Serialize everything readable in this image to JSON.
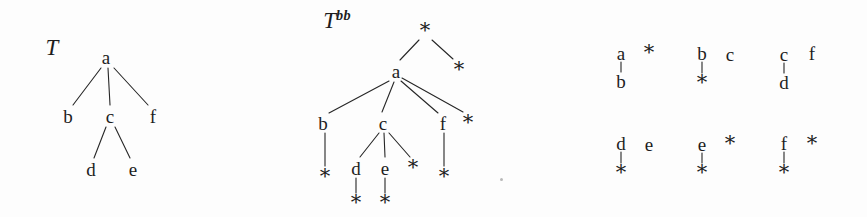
{
  "figure": {
    "domain": "diagram",
    "type": "tree-diagram",
    "background_color": "#fdfdfd",
    "ink_color": "#1d1d1d",
    "width": 867,
    "height": 217
  },
  "panels": [
    {
      "id": "original-tree",
      "label": {
        "base": "T",
        "sup": ""
      },
      "label_pos": {
        "x": 52,
        "y": 47
      },
      "description": "Original rooted ordered tree T with root a",
      "nodes": [
        {
          "id": "t-a",
          "text": "a",
          "kind": "letter",
          "x": 106,
          "y": 57
        },
        {
          "id": "t-b",
          "text": "b",
          "kind": "letter",
          "x": 68,
          "y": 116
        },
        {
          "id": "t-c",
          "text": "c",
          "kind": "letter",
          "x": 110,
          "y": 116
        },
        {
          "id": "t-f",
          "text": "f",
          "kind": "letter",
          "x": 153,
          "y": 116
        },
        {
          "id": "t-d",
          "text": "d",
          "kind": "letter",
          "x": 91,
          "y": 169
        },
        {
          "id": "t-e",
          "text": "e",
          "kind": "letter",
          "x": 133,
          "y": 169
        }
      ],
      "edges": [
        {
          "from": "t-a",
          "to": "t-b",
          "x1": 101,
          "y1": 68,
          "x2": 73,
          "y2": 105
        },
        {
          "from": "t-a",
          "to": "t-c",
          "x1": 108,
          "y1": 68,
          "x2": 110,
          "y2": 105
        },
        {
          "from": "t-a",
          "to": "t-f",
          "x1": 114,
          "y1": 68,
          "x2": 148,
          "y2": 105
        },
        {
          "from": "t-c",
          "to": "t-d",
          "x1": 106,
          "y1": 127,
          "x2": 94,
          "y2": 158
        },
        {
          "from": "t-c",
          "to": "t-e",
          "x1": 115,
          "y1": 127,
          "x2": 130,
          "y2": 158
        }
      ]
    },
    {
      "id": "binary-brother-tree",
      "label": {
        "base": "T",
        "sup": "bb"
      },
      "label_pos": {
        "x": 337,
        "y": 20
      },
      "description": "Binary-brother representation T^bb of the tree T",
      "nodes": [
        {
          "id": "bb-root",
          "text": "*",
          "kind": "star",
          "x": 425,
          "y": 30
        },
        {
          "id": "bb-a",
          "text": "a",
          "kind": "letter",
          "x": 396,
          "y": 71
        },
        {
          "id": "bb-rstar",
          "text": "*",
          "kind": "star",
          "x": 459,
          "y": 69
        },
        {
          "id": "bb-b",
          "text": "b",
          "kind": "letter",
          "x": 323,
          "y": 123
        },
        {
          "id": "bb-c",
          "text": "c",
          "kind": "letter",
          "x": 383,
          "y": 123
        },
        {
          "id": "bb-f",
          "text": "f",
          "kind": "letter",
          "x": 443,
          "y": 123
        },
        {
          "id": "bb-fstar",
          "text": "*",
          "kind": "star",
          "x": 468,
          "y": 122
        },
        {
          "id": "bb-bstar",
          "text": "*",
          "kind": "star",
          "x": 325,
          "y": 176
        },
        {
          "id": "bb-d",
          "text": "d",
          "kind": "letter",
          "x": 356,
          "y": 168
        },
        {
          "id": "bb-e",
          "text": "e",
          "kind": "letter",
          "x": 385,
          "y": 168
        },
        {
          "id": "bb-cstar",
          "text": "*",
          "kind": "star",
          "x": 413,
          "y": 167
        },
        {
          "id": "bb-fchildstar",
          "text": "*",
          "kind": "star",
          "x": 444,
          "y": 176
        },
        {
          "id": "bb-dstar",
          "text": "*",
          "kind": "star",
          "x": 356,
          "y": 202
        },
        {
          "id": "bb-estar",
          "text": "*",
          "kind": "star",
          "x": 385,
          "y": 202
        }
      ],
      "edges": [
        {
          "from": "bb-root",
          "to": "bb-a",
          "x1": 419,
          "y1": 40,
          "x2": 400,
          "y2": 60
        },
        {
          "from": "bb-root",
          "to": "bb-rstar",
          "x1": 432,
          "y1": 40,
          "x2": 453,
          "y2": 59
        },
        {
          "from": "bb-a",
          "to": "bb-b",
          "x1": 389,
          "y1": 81,
          "x2": 329,
          "y2": 113
        },
        {
          "from": "bb-a",
          "to": "bb-c",
          "x1": 394,
          "y1": 82,
          "x2": 382,
          "y2": 112
        },
        {
          "from": "bb-a",
          "to": "bb-f",
          "x1": 401,
          "y1": 81,
          "x2": 438,
          "y2": 113
        },
        {
          "from": "bb-a",
          "to": "bb-fstar",
          "x1": 402,
          "y1": 78,
          "x2": 463,
          "y2": 112
        },
        {
          "from": "bb-b",
          "to": "bb-bstar",
          "x1": 325,
          "y1": 133,
          "x2": 325,
          "y2": 166
        },
        {
          "from": "bb-c",
          "to": "bb-d",
          "x1": 379,
          "y1": 133,
          "x2": 360,
          "y2": 157
        },
        {
          "from": "bb-c",
          "to": "bb-e",
          "x1": 384,
          "y1": 133,
          "x2": 385,
          "y2": 157
        },
        {
          "from": "bb-c",
          "to": "bb-cstar",
          "x1": 389,
          "y1": 133,
          "x2": 410,
          "y2": 157
        },
        {
          "from": "bb-f",
          "to": "bb-fchildstar",
          "x1": 444,
          "y1": 133,
          "x2": 444,
          "y2": 166
        },
        {
          "from": "bb-d",
          "to": "bb-dstar",
          "x1": 356,
          "y1": 178,
          "x2": 356,
          "y2": 193
        },
        {
          "from": "bb-e",
          "to": "bb-estar",
          "x1": 385,
          "y1": 178,
          "x2": 385,
          "y2": 193
        }
      ]
    },
    {
      "id": "subtree-fragments",
      "label": {
        "base": "",
        "sup": ""
      },
      "description": "Six small two-node binary fragments, one per label a-f",
      "nodes": [
        {
          "id": "fr1-a",
          "text": "a",
          "kind": "letter",
          "x": 621,
          "y": 53
        },
        {
          "id": "fr1-star",
          "text": "*",
          "kind": "star",
          "x": 649,
          "y": 52
        },
        {
          "id": "fr1-b",
          "text": "b",
          "kind": "letter",
          "x": 621,
          "y": 81
        },
        {
          "id": "fr2-b",
          "text": "b",
          "kind": "letter",
          "x": 702,
          "y": 53
        },
        {
          "id": "fr2-c",
          "text": "c",
          "kind": "letter",
          "x": 730,
          "y": 54
        },
        {
          "id": "fr2-star",
          "text": "*",
          "kind": "star",
          "x": 702,
          "y": 82
        },
        {
          "id": "fr3-c",
          "text": "c",
          "kind": "letter",
          "x": 784,
          "y": 54
        },
        {
          "id": "fr3-f",
          "text": "f",
          "kind": "letter",
          "x": 812,
          "y": 53
        },
        {
          "id": "fr3-d",
          "text": "d",
          "kind": "letter",
          "x": 784,
          "y": 82
        },
        {
          "id": "fr4-d",
          "text": "d",
          "kind": "letter",
          "x": 621,
          "y": 143
        },
        {
          "id": "fr4-e",
          "text": "e",
          "kind": "letter",
          "x": 649,
          "y": 144
        },
        {
          "id": "fr4-star",
          "text": "*",
          "kind": "star",
          "x": 621,
          "y": 172
        },
        {
          "id": "fr5-e",
          "text": "e",
          "kind": "letter",
          "x": 702,
          "y": 144
        },
        {
          "id": "fr5-star1",
          "text": "*",
          "kind": "star",
          "x": 730,
          "y": 143
        },
        {
          "id": "fr5-star2",
          "text": "*",
          "kind": "star",
          "x": 702,
          "y": 172
        },
        {
          "id": "fr6-f",
          "text": "f",
          "kind": "letter",
          "x": 784,
          "y": 143
        },
        {
          "id": "fr6-star1",
          "text": "*",
          "kind": "star",
          "x": 812,
          "y": 143
        },
        {
          "id": "fr6-star2",
          "text": "*",
          "kind": "star",
          "x": 784,
          "y": 172
        }
      ],
      "edges": [
        {
          "from": "fr1-a",
          "to": "fr1-b",
          "x1": 621,
          "y1": 62,
          "x2": 621,
          "y2": 72
        },
        {
          "from": "fr2-b",
          "to": "fr2-star",
          "x1": 702,
          "y1": 62,
          "x2": 702,
          "y2": 73
        },
        {
          "from": "fr3-c",
          "to": "fr3-d",
          "x1": 784,
          "y1": 63,
          "x2": 784,
          "y2": 73
        },
        {
          "from": "fr4-d",
          "to": "fr4-star",
          "x1": 621,
          "y1": 152,
          "x2": 621,
          "y2": 163
        },
        {
          "from": "fr5-e",
          "to": "fr5-star2",
          "x1": 702,
          "y1": 153,
          "x2": 702,
          "y2": 163
        },
        {
          "from": "fr6-f",
          "to": "fr6-star2",
          "x1": 784,
          "y1": 152,
          "x2": 784,
          "y2": 163
        }
      ]
    }
  ],
  "specks": [
    {
      "x": 500,
      "y": 178
    }
  ]
}
